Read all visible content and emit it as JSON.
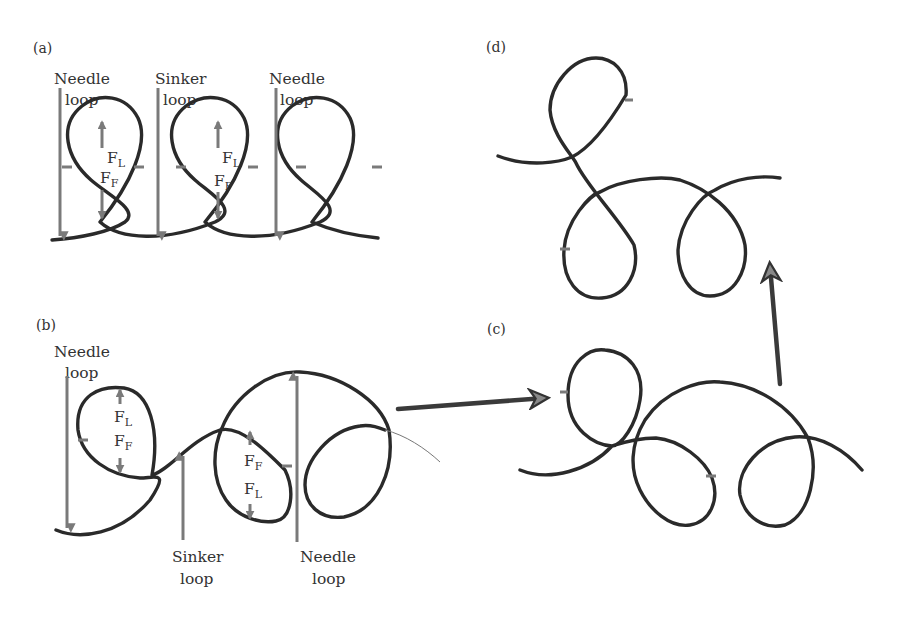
{
  "figure": {
    "panels": {
      "a": {
        "label": "(a)",
        "annotations": [
          "Needle",
          "loop",
          "Sinker",
          "loop",
          "Needle",
          "loop"
        ],
        "forces": [
          "F",
          "L",
          "F",
          "F",
          "F",
          "L",
          "F",
          "F"
        ]
      },
      "b": {
        "label": "(b)",
        "annotations": [
          "Needle",
          "loop",
          "Sinker",
          "loop",
          "Needle",
          "loop"
        ],
        "forces": [
          "F",
          "L",
          "F",
          "F",
          "F",
          "F",
          "F",
          "L"
        ]
      },
      "c": {
        "label": "(c)"
      },
      "d": {
        "label": "(d)"
      }
    },
    "colors": {
      "yarn": "#2a2a2a",
      "force_arrow": "#7a7a7a",
      "transition_arrow": "#3a3a3a",
      "arrow_head_fill": "#888888"
    }
  }
}
